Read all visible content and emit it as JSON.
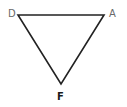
{
  "diagram": {
    "type": "triangle",
    "stroke_color": "#222222",
    "vertices": [
      {
        "label": "D",
        "x": 18,
        "y": 15,
        "color": "#6a6a6a",
        "bold": false
      },
      {
        "label": "A",
        "x": 104,
        "y": 15,
        "color": "#6a6a6a",
        "bold": false
      },
      {
        "label": "F",
        "x": 61,
        "y": 84,
        "color": "#1a1a1a",
        "bold": true
      }
    ],
    "edges": [
      [
        "D",
        "A"
      ],
      [
        "A",
        "F"
      ],
      [
        "F",
        "D"
      ]
    ]
  }
}
